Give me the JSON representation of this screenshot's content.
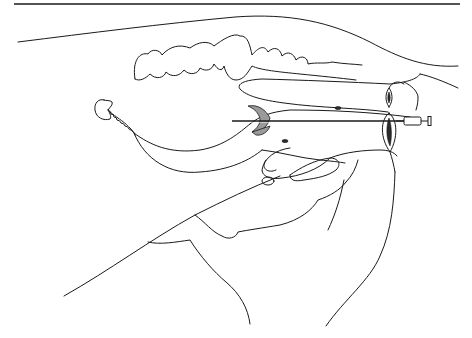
{
  "figure": {
    "text_labels": [],
    "colors": {
      "background": "#ffffff",
      "line": "#1a1a1a",
      "hatching": "#9a9a9a"
    },
    "elements": [
      {
        "name": "top-rule",
        "kind": "horizontal line"
      },
      {
        "name": "dorsal-outline",
        "kind": "curve"
      },
      {
        "name": "vertebral-column",
        "kind": "lobed outline"
      },
      {
        "name": "intestinal-loop",
        "kind": "elongated organ"
      },
      {
        "name": "kidney",
        "kind": "bean shape"
      },
      {
        "name": "ureter",
        "kind": "twisted line"
      },
      {
        "name": "bladder",
        "kind": "organ outline"
      },
      {
        "name": "hatched-region",
        "kind": "shaded crescent"
      },
      {
        "name": "needle",
        "kind": "instrument"
      },
      {
        "name": "syringe",
        "kind": "instrument"
      },
      {
        "name": "perineal-openings",
        "kind": "elliptical openings"
      },
      {
        "name": "pelvic-outline",
        "kind": "curves"
      },
      {
        "name": "hind-limb-outline",
        "kind": "curves"
      }
    ]
  }
}
